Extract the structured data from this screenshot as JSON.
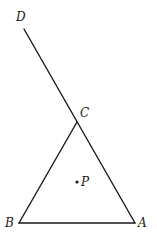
{
  "diagram": {
    "points": {
      "A": {
        "label": "A",
        "x": 135,
        "y": 223
      },
      "B": {
        "label": "B",
        "x": 19,
        "y": 223
      },
      "C": {
        "label": "C",
        "x": 77,
        "y": 122
      },
      "D": {
        "label": "D",
        "x": 24,
        "y": 29
      },
      "P": {
        "label": "P",
        "x": 77,
        "y": 182
      }
    },
    "segments": [
      {
        "from": "B",
        "to": "A"
      },
      {
        "from": "B",
        "to": "C"
      },
      {
        "from": "A",
        "to": "D"
      }
    ],
    "colors": {
      "stroke": "#1a1a1a",
      "background": "#ffffff"
    }
  }
}
